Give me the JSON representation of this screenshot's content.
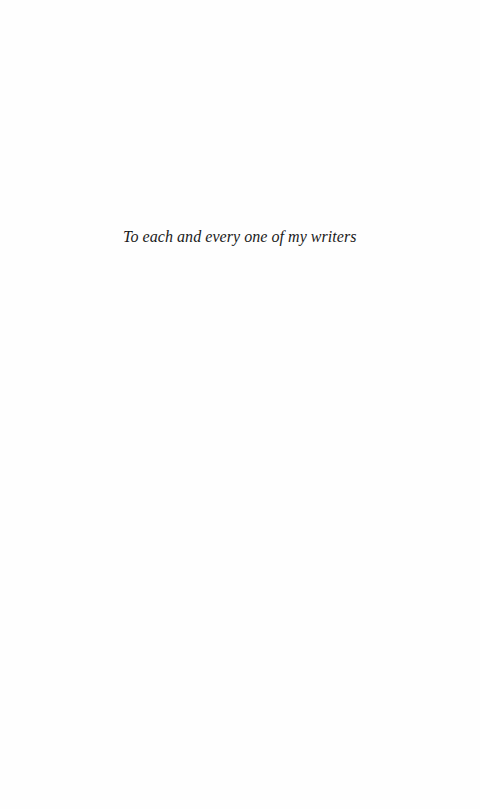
{
  "page": {
    "type": "dedication",
    "dedication_text": "To each and every one of my writers"
  },
  "colors": {
    "background": "#fefefe",
    "text": "#1a1a1a"
  }
}
